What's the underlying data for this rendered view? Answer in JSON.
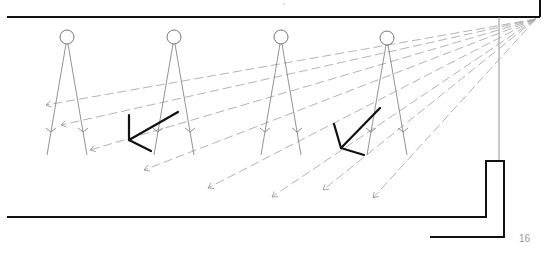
{
  "page": {
    "page_number": "16"
  },
  "colors": {
    "wall": "#111111",
    "cone": "#777777",
    "ray": "#aaaaaa",
    "reflector": "#111111",
    "page_number": "#999999"
  },
  "diagram": {
    "source_point": [
      536,
      19
    ],
    "luminaires": [
      {
        "label": "luminaire-1",
        "cx": 67,
        "cy": 37,
        "r": 7
      },
      {
        "label": "luminaire-2",
        "cx": 174,
        "cy": 37,
        "r": 7
      },
      {
        "label": "luminaire-3",
        "cx": 281,
        "cy": 37,
        "r": 7
      },
      {
        "label": "luminaire-4",
        "cx": 387,
        "cy": 38,
        "r": 7
      }
    ],
    "rays_end_points": [
      [
        46,
        105
      ],
      [
        61,
        125
      ],
      [
        90,
        150
      ],
      [
        144,
        170
      ],
      [
        208,
        188
      ],
      [
        272,
        197
      ],
      [
        323,
        190
      ],
      [
        373,
        198
      ]
    ],
    "reflectors": [
      {
        "apex": [
          129,
          140
        ],
        "arm_up": [
          129,
          115
        ],
        "arm_long": [
          178,
          112
        ],
        "arm_short": [
          151,
          151
        ]
      },
      {
        "apex": [
          341,
          148
        ],
        "arm_up": [
          334,
          124
        ],
        "arm_long": [
          380,
          108
        ],
        "arm_short": [
          364,
          155
        ]
      }
    ]
  }
}
